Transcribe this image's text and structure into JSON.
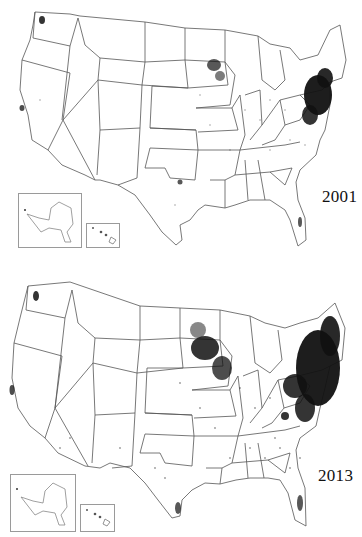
{
  "figure": {
    "panels": [
      {
        "year": "2001",
        "description": "Dot-density map of contiguous United States with Alaska and Hawaii insets; dense clusters in Northeast (New England to Virginia) and upper Midwest (Minnesota/Wisconsin); sparse dots elsewhere."
      },
      {
        "year": "2013",
        "description": "Dot-density map of contiguous United States with Alaska and Hawaii insets; greatly expanded dense clusters across Northeast, Mid-Atlantic, upper Midwest, and scattered dots in Southeast, Texas, California."
      }
    ],
    "insets": [
      "Alaska",
      "Hawaii"
    ],
    "colors": {
      "background": "#ffffff",
      "state_borders": "#555555",
      "dots": "#111111",
      "inset_border": "#9a9a9a"
    }
  }
}
